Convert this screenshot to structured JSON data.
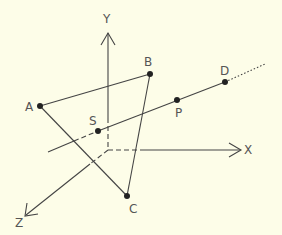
{
  "diagram": {
    "background": "#fdfde8",
    "stroke_color": "#444444",
    "axes": {
      "x": {
        "label": "X"
      },
      "y": {
        "label": "Y"
      },
      "z": {
        "label": "Z"
      }
    },
    "points": {
      "A": {
        "label": "A"
      },
      "B": {
        "label": "B"
      },
      "C": {
        "label": "C"
      },
      "S": {
        "label": "S"
      },
      "P": {
        "label": "P"
      },
      "D": {
        "label": "D"
      }
    }
  }
}
